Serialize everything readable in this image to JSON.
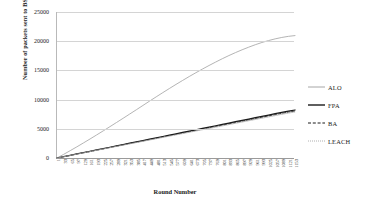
{
  "chart_data": {
    "type": "line",
    "title": "",
    "xlabel": "Round Number",
    "ylabel": "Number of packets sent to BS",
    "xlim": [
      1,
      1153
    ],
    "ylim": [
      0,
      25000
    ],
    "grid": true,
    "legend_position": "right",
    "y_ticks": [
      0,
      5000,
      10000,
      15000,
      20000,
      25000
    ],
    "y_tick_labels": [
      "0",
      "5000",
      "10000",
      "15000",
      "20000",
      "25000"
    ],
    "categories": [
      1,
      33,
      65,
      97,
      129,
      161,
      193,
      225,
      257,
      289,
      321,
      353,
      385,
      417,
      449,
      481,
      513,
      545,
      577,
      609,
      641,
      673,
      705,
      737,
      769,
      801,
      833,
      865,
      897,
      929,
      961,
      993,
      1025,
      1057,
      1089,
      1121,
      1153
    ],
    "x_tick_labels": [
      "1",
      "33",
      "65",
      "97",
      "129",
      "161",
      "193",
      "225",
      "257",
      "289",
      "321",
      "353",
      "385",
      "417",
      "449",
      "481",
      "513",
      "545",
      "577",
      "609",
      "641",
      "673",
      "705",
      "737",
      "769",
      "801",
      "833",
      "865",
      "897",
      "929",
      "961",
      "993",
      "1025",
      "1057",
      "1089",
      "1121",
      "1153"
    ],
    "series": [
      {
        "name": "ALO",
        "color": "#a6a6a6",
        "style": "solid",
        "values": [
          0,
          620,
          1260,
          1910,
          2580,
          3260,
          3950,
          4650,
          5360,
          6080,
          6800,
          7530,
          8260,
          9000,
          9740,
          10470,
          11190,
          11900,
          12600,
          13280,
          13950,
          14600,
          15230,
          15840,
          16430,
          17000,
          17540,
          18050,
          18530,
          18980,
          19400,
          19780,
          20110,
          20400,
          20640,
          20830,
          20960
        ]
      },
      {
        "name": "FPA",
        "color": "#1a1a1a",
        "style": "solid",
        "values": [
          0,
          230,
          460,
          690,
          920,
          1150,
          1380,
          1610,
          1840,
          2070,
          2300,
          2530,
          2760,
          2990,
          3220,
          3450,
          3680,
          3910,
          4140,
          4370,
          4600,
          4830,
          5060,
          5290,
          5520,
          5750,
          5980,
          6210,
          6440,
          6670,
          6900,
          7130,
          7360,
          7590,
          7820,
          8030,
          8220
        ]
      },
      {
        "name": "BA",
        "color": "#1a1a1a",
        "style": "dashed",
        "values": [
          0,
          225,
          450,
          675,
          900,
          1125,
          1350,
          1575,
          1800,
          2025,
          2250,
          2475,
          2700,
          2925,
          3150,
          3375,
          3600,
          3825,
          4050,
          4275,
          4500,
          4725,
          4950,
          5175,
          5400,
          5625,
          5850,
          6075,
          6300,
          6525,
          6750,
          6975,
          7200,
          7425,
          7650,
          7860,
          8050
        ]
      },
      {
        "name": "LEACH",
        "color": "#b0b0b0",
        "style": "dotted",
        "values": [
          0,
          220,
          440,
          660,
          880,
          1100,
          1320,
          1540,
          1760,
          1980,
          2200,
          2420,
          2640,
          2860,
          3080,
          3300,
          3520,
          3740,
          3960,
          4180,
          4400,
          4620,
          4840,
          5060,
          5280,
          5500,
          5720,
          5940,
          6160,
          6380,
          6600,
          6820,
          7040,
          7260,
          7480,
          7690,
          7880
        ]
      }
    ]
  },
  "legend": {
    "items": [
      {
        "label": "ALO"
      },
      {
        "label": "FPA"
      },
      {
        "label": "BA"
      },
      {
        "label": "LEACH"
      }
    ]
  }
}
